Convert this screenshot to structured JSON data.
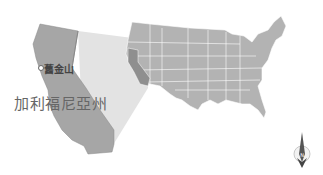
{
  "map": {
    "city_label": "舊金山",
    "state_label": "加利福尼亞州",
    "colors": {
      "state_fill": "#a6a6a6",
      "usa_fill": "#b3b3b3",
      "highlight_fill": "#e6e6e6",
      "border": "#ffffff",
      "ca_in_usa": "#8f8f8f"
    },
    "icons": [
      "compass-rose-icon",
      "city-marker-icon"
    ]
  }
}
